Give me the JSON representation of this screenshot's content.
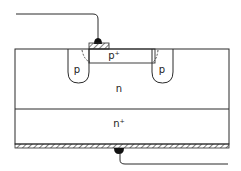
{
  "diagram": {
    "labels": {
      "p_plus": "p⁺",
      "p_left": "p",
      "p_right": "p",
      "n": "n",
      "n_plus": "n⁺"
    },
    "components": [
      {
        "id": "top-contact",
        "type": "metal contact with lead wire"
      },
      {
        "id": "p-plus-region",
        "label": "p+"
      },
      {
        "id": "guard-ring-left",
        "label": "p"
      },
      {
        "id": "guard-ring-right",
        "label": "p"
      },
      {
        "id": "n-layer",
        "label": "n"
      },
      {
        "id": "n-plus-layer",
        "label": "n+"
      },
      {
        "id": "bottom-metallization",
        "type": "hatched metal layer"
      },
      {
        "id": "bottom-contact",
        "type": "contact with lead wire"
      }
    ],
    "colors": {
      "line": "#2a2a2a",
      "background": "#ffffff"
    }
  }
}
